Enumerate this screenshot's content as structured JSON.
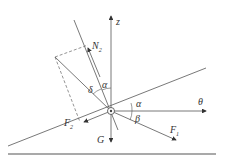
{
  "diagram": {
    "labels": {
      "z": "z",
      "N": "N",
      "N_sub": "2",
      "F2": "F",
      "F2_sub": "2",
      "F1": "F",
      "F1_sub": "1",
      "G": "G",
      "theta": "θ",
      "alpha_top": "α",
      "alpha_right": "α",
      "beta": "β",
      "delta": "δ"
    },
    "colors": {
      "line": "#444444",
      "background": "#ffffff"
    }
  }
}
